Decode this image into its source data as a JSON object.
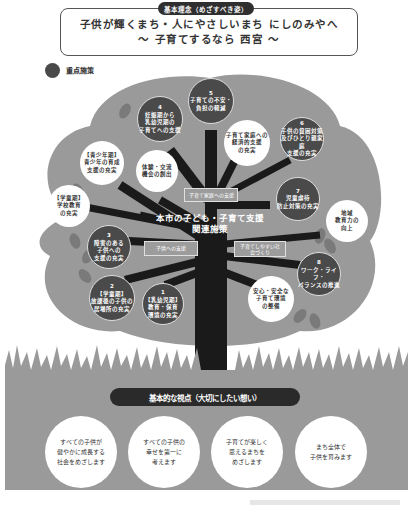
{
  "header": {
    "badge": "基本理念（めざすべき姿）",
    "vision_line1": "子供が輝くまち・人にやさしいまち にしのみやへ",
    "vision_line2": "～ 子育てするなら 西宮 ～"
  },
  "legend": {
    "label": "重点施策",
    "color": "#4a4a4a"
  },
  "tree": {
    "center_title_line1": "本市の子ども・子育て支援",
    "center_title_line2": "関連施策",
    "category_boxes": [
      {
        "id": "family",
        "label": "子育て家庭への支援"
      },
      {
        "id": "children",
        "label": "子供への支援"
      },
      {
        "id": "society",
        "label": "子育てしやすい社会づくり"
      }
    ],
    "priority_policies": [
      {
        "num": "1",
        "lines": [
          "【乳幼児期】",
          "教育・保育",
          "環境の充実"
        ]
      },
      {
        "num": "2",
        "lines": [
          "【学童期】",
          "放課後の子供の",
          "居場所の充実"
        ]
      },
      {
        "num": "3",
        "lines": [
          "障害のある",
          "子供への",
          "支援の充実"
        ]
      },
      {
        "num": "4",
        "lines": [
          "妊娠期から",
          "乳幼児期の",
          "子育てへの支援"
        ]
      },
      {
        "num": "5",
        "lines": [
          "子育ての不安・",
          "負担の軽減"
        ]
      },
      {
        "num": "6",
        "lines": [
          "子供の貧困対策",
          "及びひとり親家庭",
          "支援の充実"
        ]
      },
      {
        "num": "7",
        "lines": [
          "児童虐待",
          "防止対策の充実"
        ]
      },
      {
        "num": "8",
        "lines": [
          "ワーク・ライフ・",
          "バランスの推進"
        ]
      }
    ],
    "other_policies": [
      {
        "id": "youth",
        "lines": [
          "【青少年期】",
          "青少年の育成",
          "支援の充実"
        ]
      },
      {
        "id": "school",
        "lines": [
          "【学童期】",
          "学校教育",
          "の充実"
        ]
      },
      {
        "id": "experience",
        "lines": [
          "体験・交流",
          "機会の創出"
        ]
      },
      {
        "id": "economic",
        "lines": [
          "子育て家庭への",
          "経済的支援",
          "の充実"
        ]
      },
      {
        "id": "community",
        "lines": [
          "地域",
          "教育力の",
          "向上"
        ]
      },
      {
        "id": "safety",
        "lines": [
          "安心・安全な",
          "子育て環境",
          "の整備"
        ]
      }
    ]
  },
  "basic_views": {
    "title": "基本的な視点（大切にしたい想い）",
    "items": [
      {
        "lines": [
          "すべての子供が",
          "健やかに成長する",
          "社会をめざします"
        ]
      },
      {
        "lines": [
          "すべての子供の",
          "幸せを第一に",
          "考えます"
        ]
      },
      {
        "lines": [
          "子育てが楽しく",
          "思えるまちを",
          "めざします"
        ]
      },
      {
        "lines": [
          "まち全体で",
          "子供を育みます"
        ]
      }
    ]
  },
  "colors": {
    "canopy": "#9a9a9a",
    "trunk": "#1a1a1a",
    "priority_circle": "#4a4a4a",
    "ground": "#9a9a9a"
  }
}
